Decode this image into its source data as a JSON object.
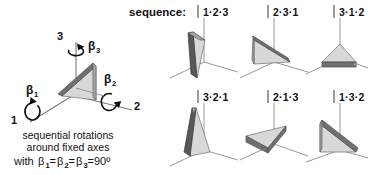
{
  "figure": {
    "title_sequence": "sequence:",
    "background_color": "#ffffff",
    "ink_color": "#111111"
  },
  "left_panel": {
    "axis_labels": {
      "axis1": "1",
      "axis2": "2",
      "axis3": "3"
    },
    "angle_labels": {
      "beta1_base": "β",
      "beta1_sub": "1",
      "beta2_base": "β",
      "beta2_sub": "2",
      "beta3_base": "β",
      "beta3_sub": "3"
    },
    "caption": {
      "line1": "sequential rotations",
      "line2": "around fixed axes",
      "line3_prefix": "with ",
      "line3_beta1": "β",
      "line3_sub1": "1",
      "line3_eq1": "=",
      "line3_beta2": "β",
      "line3_sub2": "2",
      "line3_eq2": "=",
      "line3_beta3": "β",
      "line3_sub3": "3",
      "line3_value": "=90º"
    }
  },
  "grid": {
    "rows": [
      {
        "cells": [
          {
            "label": "1·2·3",
            "orientation": "upright-tilted-wedge-facing-left"
          },
          {
            "label": "2·3·1",
            "orientation": "leaning-wedge-dark-top-edge"
          },
          {
            "label": "3·1·2",
            "orientation": "flat-lying-wedge-dark-front-edge"
          }
        ]
      },
      {
        "cells": [
          {
            "label": "3·2·1",
            "orientation": "upright-narrow-wedge"
          },
          {
            "label": "2·1·3",
            "orientation": "flat-lying-wedge-tilted-left"
          },
          {
            "label": "1·3·2",
            "orientation": "right-triangle-dark-hypotenuse"
          }
        ]
      }
    ]
  },
  "colors": {
    "face_light": "#d8d8d8",
    "face_mid": "#a8a8a8",
    "face_dark": "#707070",
    "axis": "#8c8c8c",
    "divider": "#4a4a4a"
  }
}
